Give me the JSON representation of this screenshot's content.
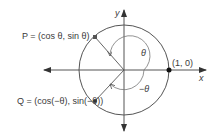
{
  "diagram": {
    "type": "unit-circle",
    "labels": {
      "x_axis": "x",
      "y_axis": "y",
      "point_one_zero": "(1, 0)",
      "point_p": "P = (cos θ, sin θ)",
      "point_q": "Q = (cos(−θ), sin(−θ))",
      "angle_theta": "θ",
      "angle_neg_theta": "−θ"
    },
    "geometry": {
      "center": [
        124,
        70
      ],
      "radius": 45,
      "theta_degrees": 135
    },
    "colors": {
      "stroke": "#555555",
      "text": "#3a3a3a",
      "point": "#111111"
    }
  }
}
